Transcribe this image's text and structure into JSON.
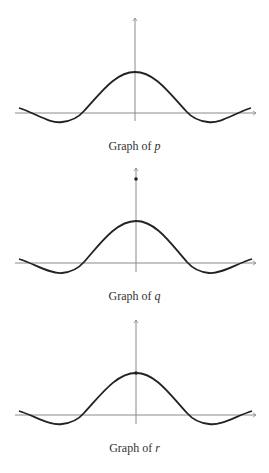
{
  "graphs": [
    {
      "id": "p",
      "caption_prefix": "Graph of ",
      "caption_var": "p",
      "axis_origin": [
        135,
        113
      ],
      "y_axis_top": 18,
      "x_axis_left": 15,
      "x_axis_right": 256,
      "peak_y": 72,
      "trough_y": 122,
      "marked_points": []
    },
    {
      "id": "q",
      "caption_prefix": "Graph of ",
      "caption_var": "q",
      "axis_origin": [
        136,
        263
      ],
      "y_axis_top": 168,
      "x_axis_left": 15,
      "x_axis_right": 256,
      "peak_y": 221,
      "trough_y": 273,
      "marked_points": [
        {
          "x": 136,
          "y": 179,
          "note": "filled dot on y-axis above the peak"
        }
      ]
    },
    {
      "id": "r",
      "caption_prefix": "Graph of ",
      "caption_var": "r",
      "axis_origin": [
        136,
        415
      ],
      "y_axis_top": 320,
      "x_axis_left": 15,
      "x_axis_right": 256,
      "peak_y": 373,
      "trough_y": 424,
      "marked_points": [
        {
          "x": 136,
          "y": 373,
          "note": "filled dot at the peak on y-axis"
        }
      ]
    }
  ],
  "colors": {
    "axis": "#8a8a8a",
    "curve": "#222222",
    "caption": "#333333"
  }
}
